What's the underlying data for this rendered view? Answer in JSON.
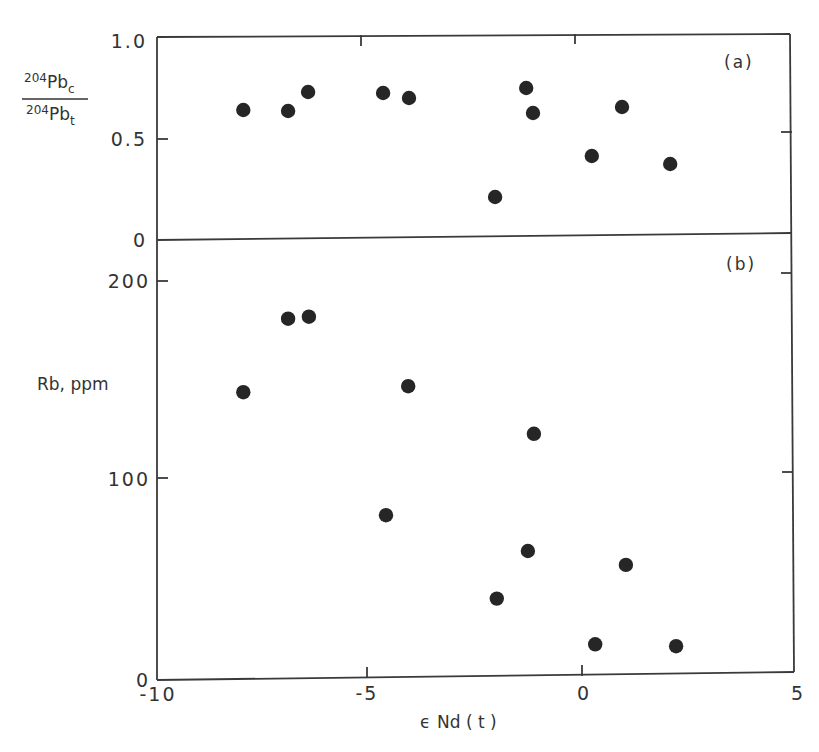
{
  "chart_data": [
    {
      "type": "scatter",
      "panel": "(a)",
      "title": "",
      "xlabel": "ε Nd (t)",
      "ylabel": "204Pb_c / 204Pb_t",
      "ylabel_numerator": "204Pb_c",
      "ylabel_denominator": "204Pb_t",
      "xlim": [
        -10,
        5
      ],
      "ylim": [
        0,
        1.0
      ],
      "yticks": [
        "0",
        "0.5",
        "1.0"
      ],
      "grid": false,
      "series": [
        {
          "name": "samples",
          "points": [
            {
              "x": -7.95,
              "y": 0.65
            },
            {
              "x": -6.9,
              "y": 0.645
            },
            {
              "x": -6.43,
              "y": 0.74
            },
            {
              "x": -4.67,
              "y": 0.735
            },
            {
              "x": -4.06,
              "y": 0.71
            },
            {
              "x": -2.04,
              "y": 0.215
            },
            {
              "x": -1.31,
              "y": 0.76
            },
            {
              "x": -1.15,
              "y": 0.635
            },
            {
              "x": 0.23,
              "y": 0.42
            },
            {
              "x": 0.94,
              "y": 0.665
            },
            {
              "x": 2.07,
              "y": 0.38
            }
          ]
        }
      ]
    },
    {
      "type": "scatter",
      "panel": "(b)",
      "title": "",
      "xlabel": "ε Nd (t)",
      "ylabel": "Rb, ppm",
      "xlim": [
        -10,
        5
      ],
      "ylim": [
        0,
        220
      ],
      "xticks": [
        "-10",
        "-5",
        "0",
        "5"
      ],
      "yticks": [
        "0",
        "100",
        "200"
      ],
      "grid": false,
      "series": [
        {
          "name": "samples",
          "points": [
            {
              "x": -7.95,
              "y": 144
            },
            {
              "x": -6.9,
              "y": 181
            },
            {
              "x": -6.41,
              "y": 182
            },
            {
              "x": -4.6,
              "y": 82
            },
            {
              "x": -4.08,
              "y": 147
            },
            {
              "x": -2.0,
              "y": 40
            },
            {
              "x": -1.27,
              "y": 64
            },
            {
              "x": -1.13,
              "y": 123
            },
            {
              "x": 0.31,
              "y": 17
            },
            {
              "x": 1.03,
              "y": 57
            },
            {
              "x": 2.21,
              "y": 16
            }
          ]
        }
      ]
    }
  ],
  "labels": {
    "panel_a": "(a)",
    "panel_b": "(b)",
    "x_axis_title_eps": "ϵ",
    "x_axis_title_rest": "Nd ( t )",
    "y_a_num_mass": "204",
    "y_a_num_elem": "Pb",
    "y_a_num_sub": "c",
    "y_a_den_mass": "204",
    "y_a_den_elem": "Pb",
    "y_a_den_sub": "t",
    "y_b_title": "Rb, ppm",
    "ya_ticks": [
      "1.0",
      "0.5",
      "0"
    ],
    "yb_ticks": [
      "200",
      "100",
      "0"
    ],
    "x_ticks": [
      "-10",
      "-5",
      "0",
      "5"
    ]
  },
  "colors": {
    "ink": "#262626",
    "background": "#ffffff"
  }
}
